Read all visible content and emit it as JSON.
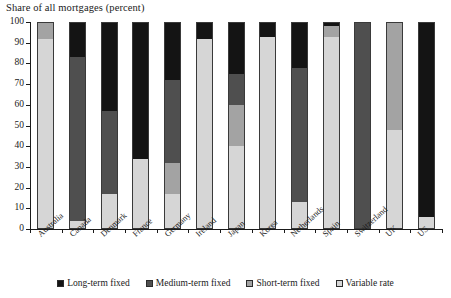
{
  "chart_data": {
    "type": "bar",
    "title": "Share of all mortgages (percent)",
    "subtitle": "",
    "xlabel": "",
    "ylabel": "",
    "ylim": [
      0,
      100
    ],
    "ytick_labels": [
      "0",
      "10",
      "20",
      "30",
      "40",
      "50",
      "60",
      "70",
      "80",
      "90",
      "100"
    ],
    "yticks": [
      0,
      10,
      20,
      30,
      40,
      50,
      60,
      70,
      80,
      90,
      100
    ],
    "grid": false,
    "stacked": true,
    "legend_position": "bottom-center",
    "categories": [
      "Australia",
      "Canada",
      "Denmark",
      "France",
      "Germany",
      "Ireland",
      "Japan",
      "Korea",
      "Netherlands",
      "Spain",
      "Switzerland",
      "UK",
      "US"
    ],
    "series": [
      {
        "name": "Long-term fixed",
        "color": "#141414",
        "values": [
          0,
          17,
          43,
          66,
          28,
          8,
          25,
          7,
          22,
          2,
          0,
          0,
          94
        ]
      },
      {
        "name": "Medium-term fixed",
        "color": "#4f4f4f",
        "values": [
          0,
          79,
          40,
          0,
          40,
          0,
          15,
          0,
          65,
          0,
          100,
          0,
          0
        ]
      },
      {
        "name": "Short-term fixed",
        "color": "#a3a3a3",
        "values": [
          8,
          0,
          0,
          0,
          15,
          0,
          20,
          0,
          0,
          5,
          0,
          52,
          0
        ]
      },
      {
        "name": "Variable rate",
        "color": "#d6d6d6",
        "values": [
          92,
          4,
          17,
          34,
          17,
          92,
          40,
          93,
          13,
          93,
          0,
          48,
          6
        ]
      }
    ]
  },
  "legend": {
    "items": [
      {
        "label": "Long-term fixed",
        "color": "#141414"
      },
      {
        "label": "Medium-term fixed",
        "color": "#4f4f4f"
      },
      {
        "label": "Short-term fixed",
        "color": "#a3a3a3"
      },
      {
        "label": "Variable rate",
        "color": "#d6d6d6"
      }
    ]
  }
}
